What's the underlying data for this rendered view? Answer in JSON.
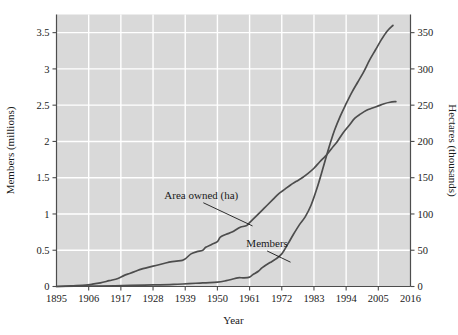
{
  "chart_data": {
    "type": "line",
    "title": "",
    "xlabel": "Year",
    "ylabel": "Members (millions)",
    "y2label": "Hectares (thousands)",
    "xlim": [
      1895,
      2016
    ],
    "ylim": [
      0,
      3.75
    ],
    "y2lim": [
      0,
      375
    ],
    "grid": true,
    "legend_position": "inline-annotations",
    "plot_background": "#d9d9d9",
    "grid_color": "#ffffff",
    "line_color": "#4d4d4d",
    "text_color": "#1a1a1a",
    "xticks": [
      1895,
      1906,
      1917,
      1928,
      1939,
      1950,
      1961,
      1972,
      1983,
      1994,
      2005,
      2016
    ],
    "xtick_labels": [
      "1895",
      "1906",
      "1917",
      "1928",
      "1939",
      "1950",
      "1961",
      "1972",
      "1983",
      "1994",
      "2005",
      "2016"
    ],
    "yticks": [
      0,
      0.5,
      1,
      1.5,
      2,
      2.5,
      3,
      3.5
    ],
    "ytick_labels": [
      "0",
      "0.5",
      "1",
      "1.5",
      "2",
      "2.5",
      "3",
      "3.5"
    ],
    "y2ticks": [
      0,
      50,
      100,
      150,
      200,
      250,
      300,
      350
    ],
    "y2tick_labels": [
      "0",
      "50",
      "100",
      "150",
      "200",
      "250",
      "300",
      "350"
    ],
    "annotations": [
      {
        "label": "Area owned (ha)",
        "text_x": 1944.5,
        "text_y": 1.21,
        "leader_to_x": 1962.0,
        "leader_to_y": 0.835
      },
      {
        "label": "Members",
        "text_x": 1967.0,
        "text_y": 0.545,
        "leader_to_x": 1975.0,
        "leader_to_y": 0.335
      }
    ],
    "series": [
      {
        "name": "Area owned (ha)",
        "axis": "right",
        "units": "thousands of hectares",
        "x": [
          1895,
          1900,
          1905,
          1907,
          1910,
          1913,
          1916,
          1918,
          1920,
          1922,
          1924,
          1926,
          1928,
          1930,
          1932,
          1934,
          1936,
          1938,
          1939,
          1941,
          1943,
          1945,
          1946,
          1948,
          1950,
          1951,
          1953,
          1955,
          1957,
          1958,
          1960,
          1961,
          1963,
          1965,
          1967,
          1969,
          1971,
          1973,
          1975,
          1977,
          1979,
          1981,
          1983,
          1985,
          1987,
          1989,
          1991,
          1993,
          1995,
          1997,
          1999,
          2001,
          2003,
          2005,
          2007,
          2009,
          2011
        ],
        "values": [
          0,
          1,
          2,
          3,
          5,
          8,
          11,
          15,
          18,
          21,
          24,
          26,
          28,
          30,
          32,
          34,
          35,
          36,
          38,
          45,
          48,
          50,
          54,
          58,
          62,
          68,
          72,
          75,
          80,
          82,
          84,
          88,
          96,
          104,
          112,
          120,
          128,
          134,
          140,
          145,
          150,
          156,
          163,
          172,
          180,
          190,
          200,
          212,
          222,
          232,
          238,
          243,
          246,
          249,
          252,
          254,
          255
        ]
      },
      {
        "name": "Members",
        "axis": "left",
        "units": "millions",
        "x": [
          1895,
          1905,
          1915,
          1925,
          1935,
          1945,
          1950,
          1953,
          1955,
          1957,
          1959,
          1961,
          1962,
          1964,
          1965,
          1966,
          1968,
          1970,
          1972,
          1974,
          1976,
          1978,
          1980,
          1982,
          1984,
          1986,
          1988,
          1990,
          1992,
          1994,
          1996,
          1998,
          2000,
          2002,
          2004,
          2006,
          2008,
          2010
        ],
        "values": [
          0,
          0.005,
          0.01,
          0.02,
          0.03,
          0.05,
          0.06,
          0.08,
          0.1,
          0.12,
          0.12,
          0.13,
          0.16,
          0.21,
          0.25,
          0.28,
          0.33,
          0.38,
          0.45,
          0.58,
          0.72,
          0.85,
          0.96,
          1.12,
          1.35,
          1.62,
          1.9,
          2.15,
          2.35,
          2.52,
          2.68,
          2.82,
          2.96,
          3.12,
          3.26,
          3.4,
          3.52,
          3.6
        ]
      }
    ]
  },
  "axes": {
    "x_title": "Year",
    "y_left_title": "Members (millions)",
    "y_right_title": "Hectares (thousands)"
  }
}
